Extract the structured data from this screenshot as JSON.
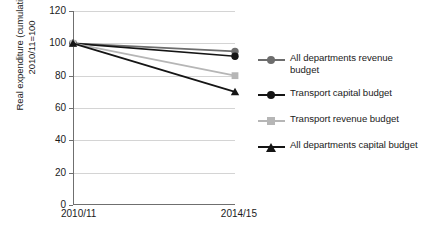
{
  "chart_data": {
    "type": "line",
    "title": "",
    "xlabel": "",
    "ylabel": "Real expenditure (cumulative),\n2010/11=100",
    "x": [
      "2010/11",
      "2014/15"
    ],
    "categories": [
      "2010/11",
      "2014/15"
    ],
    "ylim": [
      0,
      120
    ],
    "yticks": [
      0,
      20,
      40,
      60,
      80,
      100,
      120
    ],
    "ytick_labels": [
      "0",
      "20",
      "40",
      "60",
      "80",
      "100",
      "120"
    ],
    "grid": true,
    "legend_position": "right",
    "series": [
      {
        "name": "All departments revenue budget",
        "values": [
          100,
          95
        ],
        "color": "#6d6d6d",
        "marker": "circle"
      },
      {
        "name": "Transport capital budget",
        "values": [
          100,
          92
        ],
        "color": "#151515",
        "marker": "circle"
      },
      {
        "name": "Transport revenue budget",
        "values": [
          100,
          80
        ],
        "color": "#b6b6b6",
        "marker": "square"
      },
      {
        "name": "All departments capital budget",
        "values": [
          100,
          70
        ],
        "color": "#151515",
        "marker": "triangle"
      }
    ]
  },
  "axis": {
    "y_title": "Real expenditure (cumulative),\n2010/11=100",
    "x_start_label": "2010/11",
    "x_end_label": "2014/15"
  },
  "legend": {
    "items": [
      {
        "label": "All departments revenue budget",
        "color": "#6d6d6d",
        "marker": "circle"
      },
      {
        "label": "Transport capital budget",
        "color": "#151515",
        "marker": "circle"
      },
      {
        "label": "Transport revenue budget",
        "color": "#b6b6b6",
        "marker": "square"
      },
      {
        "label": "All departments capital budget",
        "color": "#151515",
        "marker": "triangle"
      }
    ]
  },
  "colors": {
    "gridline": "#d4d4d4",
    "axis": "#6f6f6f",
    "text": "#1b1b1b",
    "background": "#ffffff"
  }
}
